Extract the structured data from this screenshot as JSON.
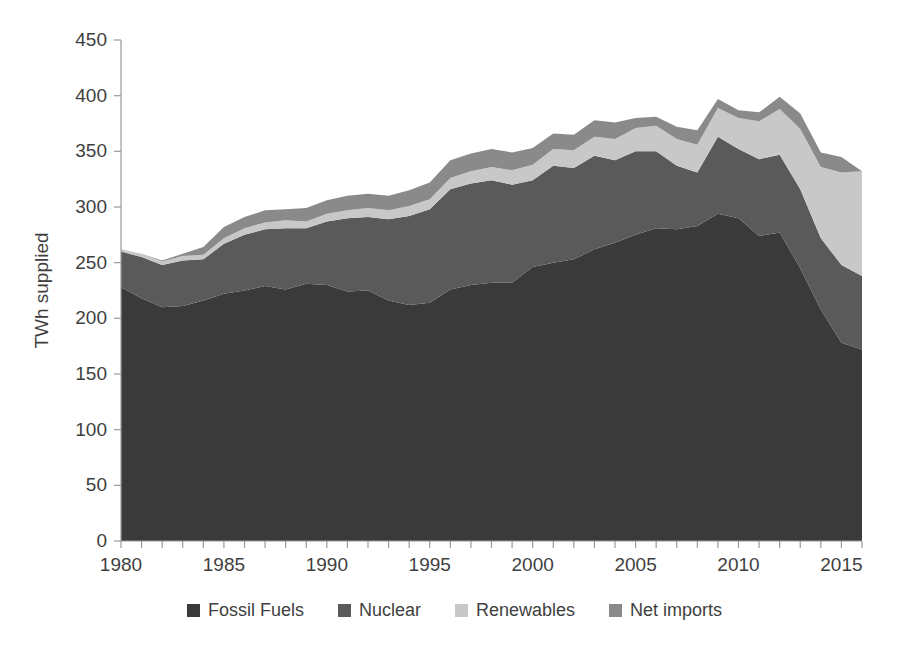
{
  "chart_data": {
    "type": "area",
    "stacked": true,
    "title": "",
    "xlabel": "",
    "ylabel": "TWh supplied",
    "xlim": [
      1980,
      2016
    ],
    "ylim": [
      0,
      450
    ],
    "y_ticks": [
      0,
      50,
      100,
      150,
      200,
      250,
      300,
      350,
      400,
      450
    ],
    "x_ticks": [
      1980,
      1985,
      1990,
      1995,
      2000,
      2005,
      2010,
      2015
    ],
    "x_tick_labels": [
      "1980",
      "1985",
      "1990",
      "1995",
      "2000",
      "2005",
      "2010",
      "2015"
    ],
    "y_tick_labels": [
      "0",
      "50",
      "100",
      "150",
      "200",
      "250",
      "300",
      "350",
      "400",
      "450"
    ],
    "x_minor_tick_interval": 1,
    "grid": false,
    "legend_position": "bottom",
    "x": [
      1980,
      1981,
      1982,
      1983,
      1984,
      1985,
      1986,
      1987,
      1988,
      1989,
      1990,
      1991,
      1992,
      1993,
      1994,
      1995,
      1996,
      1997,
      1998,
      1999,
      2000,
      2001,
      2002,
      2003,
      2004,
      2005,
      2006,
      2007,
      2008,
      2009,
      2010,
      2011,
      2012,
      2013,
      2014,
      2015,
      2016
    ],
    "series": [
      {
        "name": "Fossil Fuels",
        "color": "#3a3a3a",
        "values": [
          228,
          218,
          210,
          211,
          216,
          222,
          225,
          229,
          226,
          231,
          230,
          224,
          225,
          216,
          212,
          214,
          226,
          230,
          232,
          232,
          246,
          250,
          253,
          262,
          268,
          275,
          281,
          280,
          283,
          294,
          290,
          274,
          277,
          245,
          208,
          178,
          172
        ]
      },
      {
        "name": "Nuclear",
        "color": "#5a5a5a",
        "values": [
          32,
          37,
          38,
          41,
          37,
          45,
          50,
          51,
          55,
          50,
          57,
          66,
          66,
          73,
          80,
          84,
          90,
          91,
          92,
          88,
          78,
          87,
          82,
          84,
          74,
          75,
          69,
          57,
          48,
          69,
          62,
          69,
          70,
          71,
          64,
          70,
          66
        ]
      },
      {
        "name": "Renewables",
        "color": "#c8c8c8",
        "values": [
          2,
          3,
          3,
          4,
          4,
          5,
          6,
          6,
          7,
          6,
          7,
          7,
          8,
          8,
          9,
          9,
          10,
          11,
          12,
          13,
          14,
          15,
          16,
          17,
          19,
          21,
          23,
          24,
          25,
          26,
          28,
          34,
          41,
          54,
          64,
          83,
          94
        ]
      },
      {
        "name": "Net imports",
        "color": "#8a8a8a",
        "values": [
          0,
          0,
          1,
          2,
          7,
          10,
          10,
          11,
          10,
          12,
          12,
          13,
          13,
          13,
          14,
          15,
          16,
          16,
          16,
          16,
          15,
          14,
          14,
          15,
          15,
          9,
          8,
          11,
          13,
          8,
          7,
          8,
          11,
          14,
          13,
          14,
          0
        ]
      }
    ],
    "annotations": []
  },
  "legend": {
    "items": [
      {
        "label": "Fossil Fuels",
        "color": "#3a3a3a"
      },
      {
        "label": "Nuclear",
        "color": "#5a5a5a"
      },
      {
        "label": "Renewables",
        "color": "#c8c8c8"
      },
      {
        "label": "Net imports",
        "color": "#8a8a8a"
      }
    ]
  },
  "axis": {
    "y_title": "TWh supplied"
  }
}
